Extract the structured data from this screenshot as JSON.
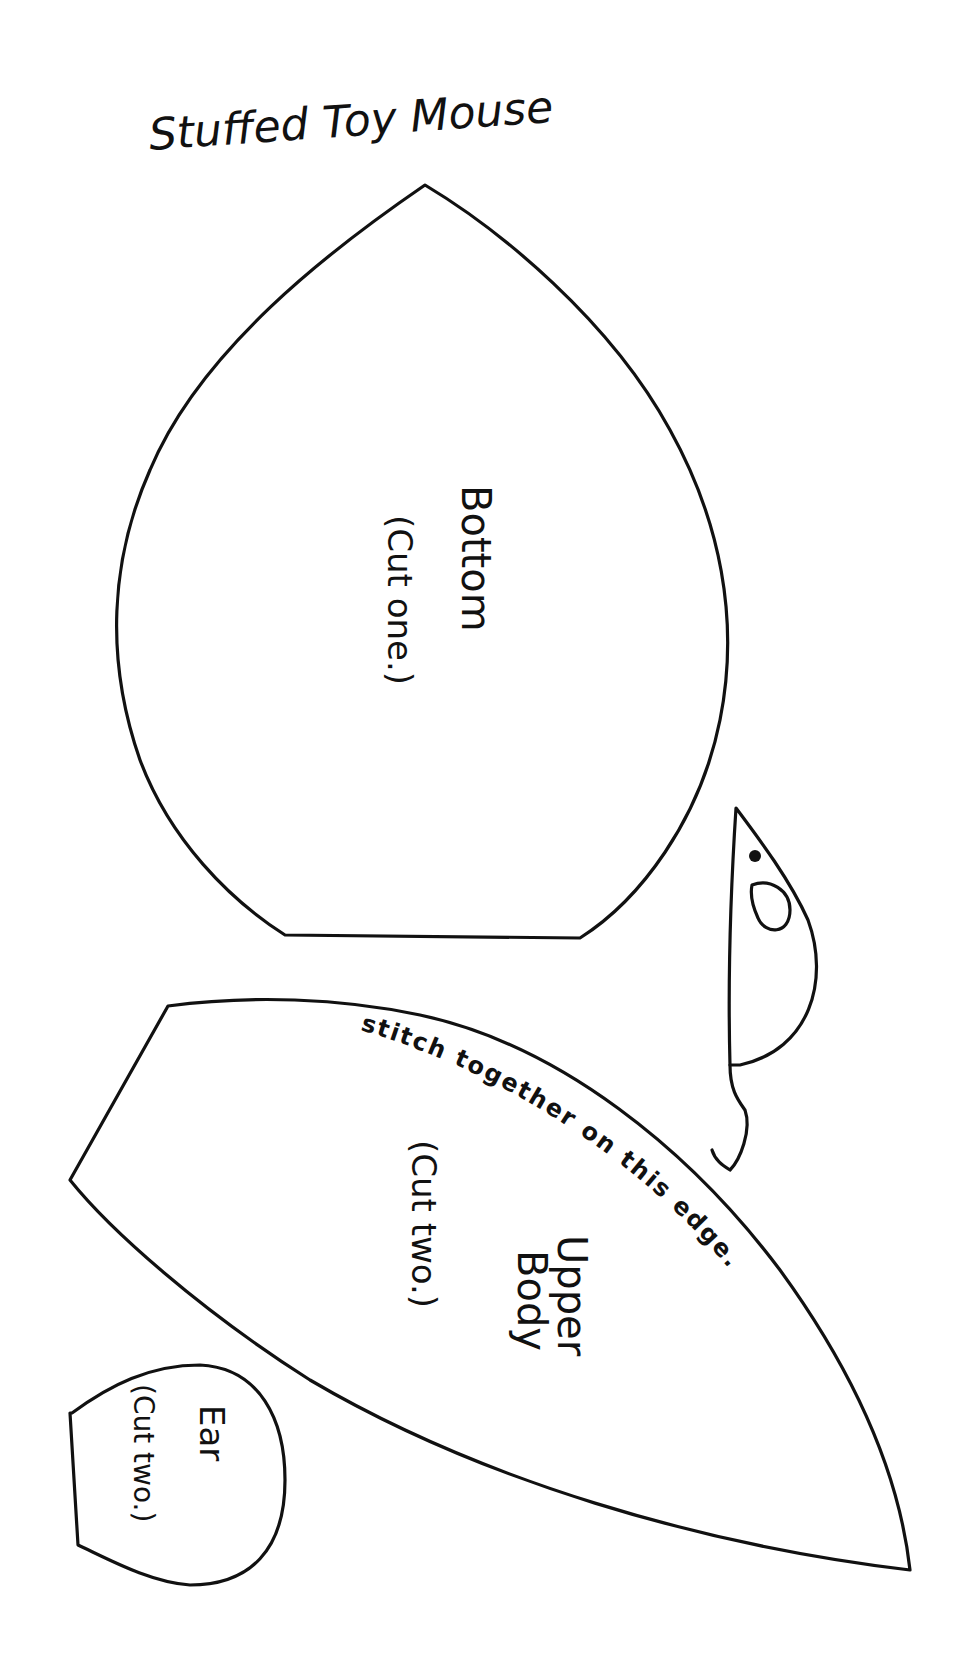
{
  "title": "Stuffed Toy Mouse",
  "pieces": {
    "bottom": {
      "name": "Bottom",
      "instruction": "(Cut one.)"
    },
    "upper_body": {
      "name_line1": "Upper",
      "name_line2": "Body",
      "instruction": "(Cut two.)",
      "edge_note": "stitch together on this edge."
    },
    "ear": {
      "name": "Ear",
      "instruction": "(Cut two.)"
    }
  },
  "illustration": "mouse-figure",
  "colors": {
    "ink": "#111111",
    "paper": "#ffffff"
  }
}
